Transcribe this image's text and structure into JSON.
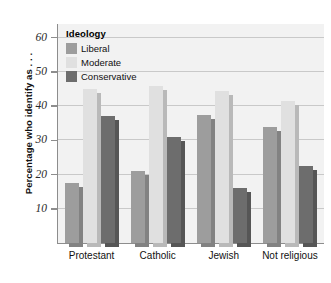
{
  "chart_data": {
    "type": "bar",
    "title": "",
    "xlabel": "",
    "ylabel": "Percentage who identify as . . .",
    "categories": [
      "Protestant",
      "Catholic",
      "Jewish",
      "Not religious"
    ],
    "series": [
      {
        "name": "Liberal",
        "color": "#9d9d9d",
        "values": [
          17.4,
          21.0,
          37.4,
          34.0
        ]
      },
      {
        "name": "Moderate",
        "color": "#e0e0e0",
        "values": [
          44.9,
          46.0,
          44.5,
          41.5
        ]
      },
      {
        "name": "Conservative",
        "color": "#6d6d6d",
        "values": [
          37.0,
          31.0,
          16.0,
          22.6
        ]
      }
    ],
    "ylim": [
      0,
      64
    ],
    "yticks": [
      10,
      20,
      30,
      40,
      50,
      60
    ],
    "ytick_labels": [
      "10",
      "20",
      "30",
      "40",
      "50",
      "60"
    ],
    "grid": true,
    "legend": {
      "title": "Ideology",
      "position": "top-left"
    },
    "plot_background": "#f2f2f2"
  },
  "legend": {
    "title": "Ideology",
    "entries": [
      {
        "label": "Liberal"
      },
      {
        "label": "Moderate"
      },
      {
        "label": "Conservative"
      }
    ]
  },
  "axes": {
    "y_title": "Percentage who identify as . . ."
  }
}
